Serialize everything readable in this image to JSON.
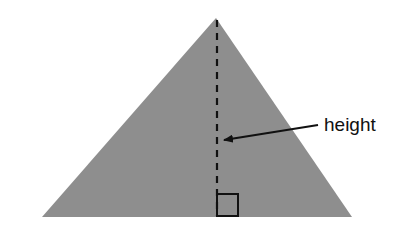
{
  "diagram": {
    "label": "height",
    "colors": {
      "triangle_fill": "#8e8e8e",
      "line": "#111111",
      "background": "#ffffff"
    },
    "elements": [
      "triangle",
      "altitude-dashed-line",
      "right-angle-marker",
      "arrow",
      "height-label"
    ]
  }
}
